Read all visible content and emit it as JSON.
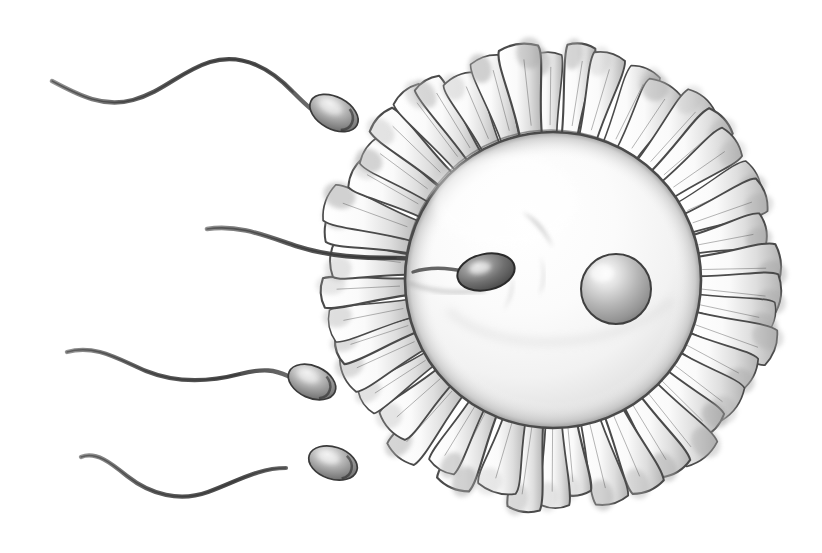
{
  "illustration": {
    "title": "Fertilization of a human ovum by spermatozoa",
    "style": "pencil-drawing-grayscale",
    "background_color": "#ffffff",
    "ink_color": "#3a3a3a",
    "shade_color": "#9a9a9a",
    "width": 822,
    "height": 553
  },
  "ovum": {
    "label": "ovum",
    "center_x": 553,
    "center_y": 280,
    "radius": 148,
    "fill_light": "#fdfdfd",
    "fill_mid": "#f0f0f0",
    "fill_shadow": "#cfcfcf",
    "outline_color": "#4a4a4a"
  },
  "nucleus": {
    "label": "pronucleus",
    "center_x": 616,
    "center_y": 289,
    "radius": 35,
    "highlight_x": 602,
    "highlight_y": 272,
    "fill_light": "#f2f2f2",
    "fill_dark": "#8d8d8d",
    "outline_color": "#3f3f3f"
  },
  "corona_radiata": {
    "label": "corona radiata",
    "center_x": 551,
    "center_y": 276,
    "inner_radius": 146,
    "outer_radius": 232,
    "cell_count": 46,
    "cell_shape": "teardrop",
    "outline_color": "#4a4a4a",
    "shade_color": "#a8a8a8"
  },
  "penetrating_sperm": {
    "label": "penetrating spermatozoon",
    "head_center_x": 486,
    "head_center_y": 272,
    "head_rx": 29,
    "head_ry": 18,
    "head_rotation": -12,
    "head_fill": "#6e6e6e",
    "head_outline": "#2e2e2e",
    "tail_start_x": 206,
    "tail_start_y": 229
  },
  "free_sperm": [
    {
      "label": "spermatozoon-top-left",
      "head_center_x": 334,
      "head_center_y": 113,
      "head_rx": 26,
      "head_ry": 16,
      "head_rotation": 28,
      "tail_tip_x": 51,
      "tail_tip_y": 81
    },
    {
      "label": "spermatozoon-mid-left",
      "head_center_x": 312,
      "head_center_y": 382,
      "head_rx": 25,
      "head_ry": 16,
      "head_rotation": 24,
      "tail_tip_x": 66,
      "tail_tip_y": 352
    },
    {
      "label": "spermatozoon-bottom-left",
      "head_center_x": 333,
      "head_center_y": 463,
      "head_rx": 25,
      "head_ry": 16,
      "head_rotation": 18,
      "tail_tip_x": 80,
      "tail_tip_y": 456
    }
  ],
  "cytoplasm_marks": [
    {
      "label": "crescent-upper",
      "path": "M 525 213 C 537 216 549 228 553 243 C 546 233 536 222 525 213 Z"
    },
    {
      "label": "crescent-lower",
      "path": "M 541 258 C 546 268 546 282 540 294 C 543 281 543 269 541 258 Z"
    },
    {
      "label": "crescent-left",
      "path": "M 513 277 C 515 288 512 300 505 309 C 511 298 513 287 513 277 Z"
    }
  ]
}
